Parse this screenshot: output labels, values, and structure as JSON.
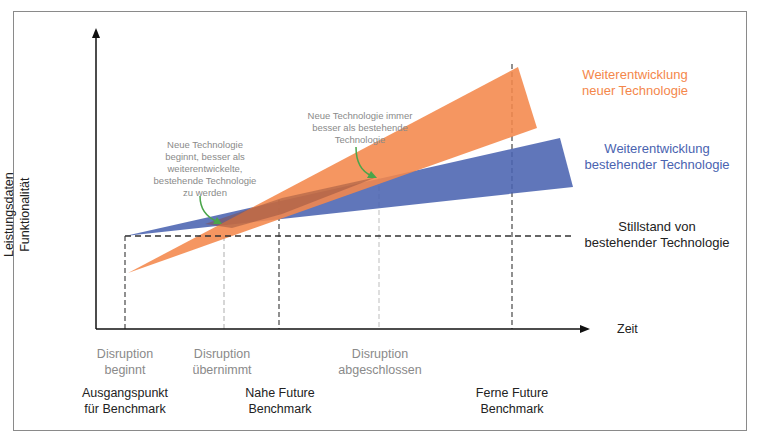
{
  "diagram": {
    "type": "disruption-technology-curve",
    "axes": {
      "y_label_line1": "Leistungsdaten",
      "y_label_line2": "Funktionalität",
      "x_label": "Zeit"
    },
    "series": [
      {
        "name_line1": "Weiterentwicklung",
        "name_line2": "neuer Technologie",
        "color": "#f4874b"
      },
      {
        "name_line1": "Weiterentwicklung",
        "name_line2": "bestehender Technologie",
        "color": "#4a63b0"
      },
      {
        "name_line1": "Stillstand von",
        "name_line2": "bestehender Technologie",
        "color": "#333333"
      }
    ],
    "annotations": {
      "first_crossing": [
        "Neue Technologie",
        "beginnt, besser als",
        "weiterentwickelte,",
        "bestehende Technologie",
        "zu werden"
      ],
      "second_crossing": [
        "Neue Technologie immer",
        "besser als bestehende",
        "Technologie"
      ],
      "arrow_color": "#4aa54a"
    },
    "phases": [
      {
        "line1": "Disruption",
        "line2": "beginnt"
      },
      {
        "line1": "Disruption",
        "line2": "übernimmt"
      },
      {
        "line1": "Disruption",
        "line2": "abgeschlossen"
      }
    ],
    "benchmarks": [
      {
        "line1": "Ausgangspunkt",
        "line2": "für Benchmark"
      },
      {
        "line1": "Nahe Future",
        "line2": "Benchmark"
      },
      {
        "line1": "Ferne Future",
        "line2": "Benchmark"
      }
    ]
  }
}
